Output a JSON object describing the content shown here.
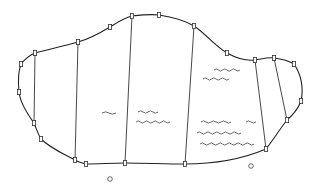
{
  "diagram": {
    "type": "land-parcel-sketch",
    "colors": {
      "line": "#222222",
      "background": "#ffffff"
    },
    "outline_points": [
      [
        21,
        64
      ],
      [
        35,
        53
      ],
      [
        78,
        42
      ],
      [
        110,
        27
      ],
      [
        132,
        16
      ],
      [
        159,
        15
      ],
      [
        194,
        26
      ],
      [
        227,
        53
      ],
      [
        255,
        60
      ],
      [
        274,
        58
      ],
      [
        294,
        64
      ],
      [
        301,
        101
      ],
      [
        287,
        120
      ],
      [
        266,
        149
      ],
      [
        185,
        164
      ],
      [
        125,
        163
      ],
      [
        86,
        164
      ],
      [
        75,
        160
      ],
      [
        41,
        139
      ],
      [
        34,
        123
      ],
      [
        19,
        92
      ],
      [
        21,
        64
      ]
    ],
    "markers": [
      [
        21,
        64
      ],
      [
        35,
        53
      ],
      [
        78,
        42
      ],
      [
        110,
        27
      ],
      [
        132,
        16
      ],
      [
        159,
        15
      ],
      [
        194,
        26
      ],
      [
        227,
        53
      ],
      [
        255,
        60
      ],
      [
        274,
        58
      ],
      [
        294,
        64
      ],
      [
        301,
        101
      ],
      [
        287,
        120
      ],
      [
        266,
        149
      ],
      [
        185,
        164
      ],
      [
        125,
        163
      ],
      [
        86,
        164
      ],
      [
        75,
        160
      ],
      [
        41,
        139
      ],
      [
        34,
        123
      ],
      [
        19,
        92
      ]
    ],
    "dividers": [
      {
        "from": [
          35,
          53
        ],
        "to": [
          34,
          123
        ]
      },
      {
        "from": [
          78,
          42
        ],
        "to": [
          75,
          160
        ]
      },
      {
        "from": [
          132,
          16
        ],
        "to": [
          125,
          163
        ]
      },
      {
        "from": [
          194,
          26
        ],
        "to": [
          185,
          164
        ]
      },
      {
        "from": [
          255,
          60
        ],
        "to": [
          266,
          149
        ]
      },
      {
        "from": [
          274,
          58
        ],
        "to": [
          287,
          120
        ]
      }
    ],
    "wave_symbols": [
      {
        "x": 102,
        "y": 113,
        "w": 14,
        "n": 1
      },
      {
        "x": 138,
        "y": 112,
        "w": 20,
        "n": 2
      },
      {
        "x": 136,
        "y": 122,
        "w": 34,
        "n": 4
      },
      {
        "x": 214,
        "y": 70,
        "w": 26,
        "n": 3
      },
      {
        "x": 203,
        "y": 79,
        "w": 26,
        "n": 3
      },
      {
        "x": 201,
        "y": 122,
        "w": 30,
        "n": 3
      },
      {
        "x": 246,
        "y": 122,
        "w": 10,
        "n": 1
      },
      {
        "x": 197,
        "y": 133,
        "w": 44,
        "n": 5
      },
      {
        "x": 200,
        "y": 144,
        "w": 54,
        "n": 6
      }
    ],
    "circles": [
      {
        "cx": 110,
        "cy": 179,
        "r": 2.3
      },
      {
        "cx": 251,
        "cy": 166,
        "r": 2.3
      }
    ]
  }
}
